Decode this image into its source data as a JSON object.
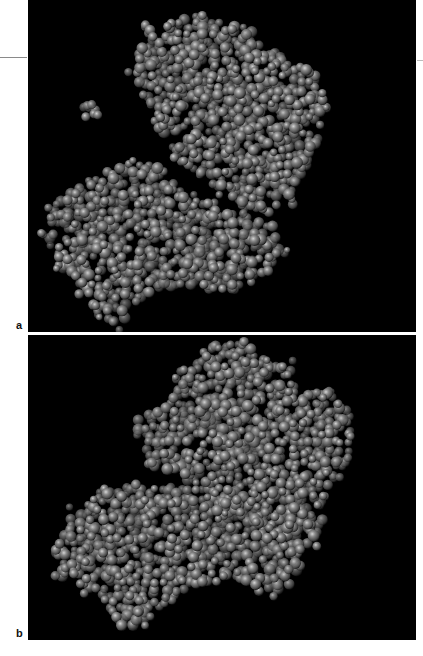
{
  "figure": {
    "background": "#ffffff",
    "panel_color": "#000000",
    "sphere_color": "#8c8c8c",
    "sphere_highlight": "#d8d8d8",
    "sphere_shadow": "#1a1a1a",
    "panels": [
      {
        "id": "a",
        "label": "a",
        "description": "Space-filling molecular model of protein with separate small ligand",
        "box": {
          "x": 28,
          "y": 0,
          "w": 388,
          "h": 332
        },
        "label_pos": {
          "x": 16,
          "y": 320
        },
        "seed": 11,
        "clusters": [
          {
            "name": "upper-domain",
            "density": 0.9,
            "outline": [
              [
                120,
                22
              ],
              [
                175,
                15
              ],
              [
                220,
                28
              ],
              [
                250,
                55
              ],
              [
                290,
                75
              ],
              [
                300,
                110
              ],
              [
                290,
                145
              ],
              [
                275,
                170
              ],
              [
                260,
                200
              ],
              [
                240,
                215
              ],
              [
                215,
                205
              ],
              [
                190,
                190
              ],
              [
                150,
                160
              ],
              [
                120,
                110
              ],
              [
                105,
                70
              ]
            ]
          },
          {
            "name": "lower-left-domain",
            "density": 0.9,
            "outline": [
              [
                25,
                205
              ],
              [
                60,
                180
              ],
              [
                100,
                160
              ],
              [
                130,
                165
              ],
              [
                160,
                190
              ],
              [
                185,
                205
              ],
              [
                215,
                210
              ],
              [
                245,
                225
              ],
              [
                255,
                255
              ],
              [
                240,
                275
              ],
              [
                210,
                290
              ],
              [
                175,
                290
              ],
              [
                135,
                285
              ],
              [
                110,
                305
              ],
              [
                90,
                325
              ],
              [
                70,
                315
              ],
              [
                55,
                290
              ],
              [
                30,
                265
              ],
              [
                18,
                235
              ]
            ]
          },
          {
            "name": "ligand",
            "density": 1.0,
            "small": true,
            "outline": [
              [
                54,
                104
              ],
              [
                70,
                103
              ],
              [
                72,
                120
              ],
              [
                56,
                122
              ]
            ]
          }
        ]
      },
      {
        "id": "b",
        "label": "b",
        "description": "Space-filling molecular model of protein in closed conformation",
        "box": {
          "x": 28,
          "y": 335,
          "w": 388,
          "h": 305
        },
        "label_pos": {
          "x": 16,
          "y": 628
        },
        "seed": 29,
        "clusters": [
          {
            "name": "upper-domain",
            "density": 0.9,
            "outline": [
              [
                180,
                5
              ],
              [
                215,
                3
              ],
              [
                240,
                25
              ],
              [
                262,
                30
              ],
              [
                265,
                55
              ],
              [
                300,
                58
              ],
              [
                320,
                72
              ],
              [
                325,
                100
              ],
              [
                320,
                130
              ],
              [
                300,
                160
              ],
              [
                280,
                185
              ],
              [
                260,
                200
              ],
              [
                230,
                190
              ],
              [
                195,
                175
              ],
              [
                170,
                150
              ],
              [
                120,
                130
              ],
              [
                105,
                110
              ],
              [
                110,
                85
              ],
              [
                135,
                70
              ],
              [
                150,
                40
              ],
              [
                170,
                20
              ]
            ]
          },
          {
            "name": "lower-domain",
            "density": 0.9,
            "outline": [
              [
                25,
                215
              ],
              [
                45,
                175
              ],
              [
                75,
                155
              ],
              [
                110,
                150
              ],
              [
                150,
                150
              ],
              [
                190,
                160
              ],
              [
                230,
                170
              ],
              [
                275,
                175
              ],
              [
                295,
                185
              ],
              [
                285,
                210
              ],
              [
                270,
                240
              ],
              [
                250,
                265
              ],
              [
                235,
                260
              ],
              [
                215,
                245
              ],
              [
                190,
                245
              ],
              [
                165,
                250
              ],
              [
                140,
                265
              ],
              [
                115,
                290
              ],
              [
                95,
                295
              ],
              [
                80,
                270
              ],
              [
                60,
                255
              ],
              [
                30,
                240
              ]
            ]
          }
        ]
      }
    ],
    "margin_rules": [
      {
        "x": 0,
        "y": 57,
        "w": 27
      },
      {
        "x": 417,
        "y": 60,
        "w": 6
      }
    ],
    "footer_caption_ghost": "                                                                  "
  }
}
